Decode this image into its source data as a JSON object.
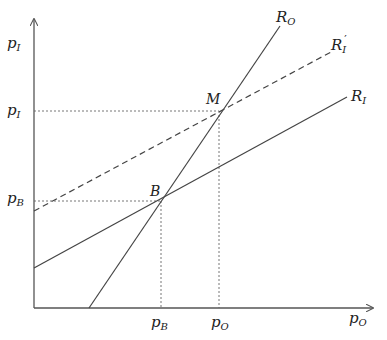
{
  "diagram": {
    "axes": {
      "y_label": {
        "main": "p",
        "sub": "I"
      },
      "x_label": {
        "main": "p",
        "sub": "O"
      }
    },
    "y_ticks": [
      {
        "main": "p",
        "sub": "I",
        "id": "pI"
      },
      {
        "main": "p",
        "sub": "B",
        "id": "pB"
      }
    ],
    "x_ticks": [
      {
        "main": "p",
        "sub": "B",
        "id": "pB"
      },
      {
        "main": "p",
        "sub": "O",
        "id": "pO"
      }
    ],
    "curves": [
      {
        "id": "R_O",
        "main": "R",
        "sub": "O",
        "prime": "",
        "style": "solid"
      },
      {
        "id": "R_I_prime",
        "main": "R",
        "sub": "I",
        "prime": "′",
        "style": "dashed"
      },
      {
        "id": "R_I",
        "main": "R",
        "sub": "I",
        "prime": "",
        "style": "solid"
      }
    ],
    "points": [
      {
        "id": "M",
        "label": "M"
      },
      {
        "id": "B",
        "label": "B"
      }
    ],
    "colors": {
      "line": "#444444",
      "axis": "#555555",
      "text": "#222222"
    }
  }
}
